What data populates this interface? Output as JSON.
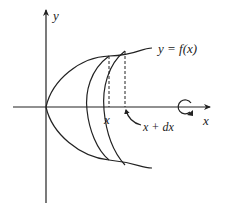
{
  "diagram": {
    "type": "solid-of-revolution-shell",
    "labels": {
      "y_axis": "y",
      "x_axis": "x",
      "curve": "y = f(x)",
      "x_point": "x",
      "x_plus_dx": "x + dx"
    },
    "icons": {
      "rotation": "rotation-arrow-icon"
    },
    "colors": {
      "stroke": "#222222",
      "background": "#ffffff"
    }
  }
}
